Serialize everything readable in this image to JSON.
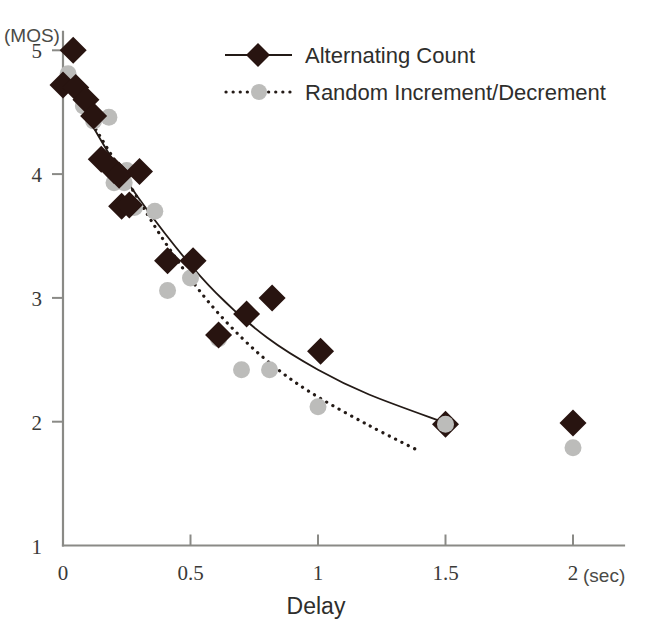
{
  "chart_data": {
    "type": "scatter",
    "title": "",
    "xlabel": "Delay",
    "ylabel": "",
    "x_unit": "(sec)",
    "y_unit": "(MOS)",
    "xlim": [
      0,
      2.2
    ],
    "ylim": [
      1,
      5.15
    ],
    "xticks": [
      0,
      0.5,
      1,
      1.5,
      2
    ],
    "xtick_labels": [
      "0",
      "0.5",
      "1",
      "1.5",
      "2"
    ],
    "yticks": [
      1,
      2,
      3,
      4,
      5
    ],
    "ytick_labels": [
      "1",
      "2",
      "3",
      "4",
      "5"
    ],
    "grid": false,
    "legend_position": "top-right",
    "series": [
      {
        "name": "Alternating Count",
        "marker": "diamond",
        "color": "#281410",
        "line_style": "solid",
        "points": [
          [
            0.0,
            4.72
          ],
          [
            0.04,
            5.0
          ],
          [
            0.05,
            4.7
          ],
          [
            0.09,
            4.6
          ],
          [
            0.12,
            4.47
          ],
          [
            0.15,
            4.12
          ],
          [
            0.2,
            4.03
          ],
          [
            0.22,
            3.99
          ],
          [
            0.23,
            3.74
          ],
          [
            0.26,
            3.75
          ],
          [
            0.3,
            4.02
          ],
          [
            0.41,
            3.3
          ],
          [
            0.51,
            3.3
          ],
          [
            0.61,
            2.7
          ],
          [
            0.72,
            2.87
          ],
          [
            0.82,
            3.0
          ],
          [
            1.01,
            2.57
          ],
          [
            1.5,
            1.98
          ],
          [
            2.0,
            1.99
          ]
        ],
        "fit_curve": [
          [
            0.02,
            4.74
          ],
          [
            0.2,
            4.1
          ],
          [
            0.4,
            3.52
          ],
          [
            0.6,
            3.04
          ],
          [
            0.8,
            2.68
          ],
          [
            1.0,
            2.42
          ],
          [
            1.2,
            2.22
          ],
          [
            1.5,
            1.99
          ]
        ]
      },
      {
        "name": "Random Increment/Decrement",
        "marker": "circle",
        "color": "#bcbcba",
        "line_style": "dotted",
        "points": [
          [
            0.02,
            4.81
          ],
          [
            0.08,
            4.55
          ],
          [
            0.12,
            4.43
          ],
          [
            0.18,
            4.46
          ],
          [
            0.2,
            3.93
          ],
          [
            0.24,
            3.93
          ],
          [
            0.25,
            4.03
          ],
          [
            0.28,
            3.73
          ],
          [
            0.36,
            3.7
          ],
          [
            0.41,
            3.06
          ],
          [
            0.5,
            3.16
          ],
          [
            0.61,
            2.67
          ],
          [
            0.7,
            2.42
          ],
          [
            0.81,
            2.42
          ],
          [
            1.0,
            2.12
          ],
          [
            1.5,
            1.98
          ],
          [
            2.0,
            1.79
          ]
        ],
        "fit_curve": [
          [
            0.1,
            4.46
          ],
          [
            0.25,
            3.95
          ],
          [
            0.4,
            3.45
          ],
          [
            0.55,
            3.02
          ],
          [
            0.7,
            2.68
          ],
          [
            0.85,
            2.41
          ],
          [
            1.0,
            2.2
          ],
          [
            1.2,
            1.97
          ],
          [
            1.39,
            1.77
          ]
        ]
      }
    ]
  }
}
